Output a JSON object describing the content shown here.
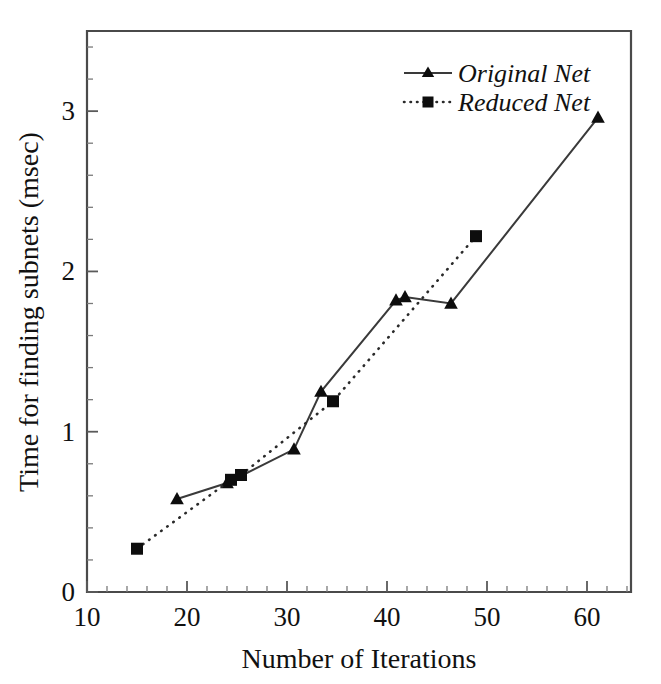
{
  "chart_data": {
    "type": "line",
    "title": "",
    "xlabel": "Number of Iterations",
    "ylabel": "Time for finding subnets (msec)",
    "xlim": [
      10,
      64.4
    ],
    "ylim": [
      0,
      3.5
    ],
    "xticks": [
      10,
      20,
      30,
      40,
      50,
      60
    ],
    "yticks": [
      0,
      1,
      2,
      3
    ],
    "xtick_labels": [
      "10",
      "20",
      "30",
      "40",
      "50",
      "60"
    ],
    "ytick_labels": [
      "0",
      "1",
      "2",
      "3"
    ],
    "x_minor_step": 2,
    "y_minor_step": 0.2,
    "grid": false,
    "legend_position": "top-right",
    "series": [
      {
        "name": "Original  Net",
        "marker": "triangle",
        "linestyle": "solid",
        "color": "#0d0d0d",
        "points": [
          {
            "x": 19.0,
            "y": 0.58
          },
          {
            "x": 24.0,
            "y": 0.68
          },
          {
            "x": 30.7,
            "y": 0.89
          },
          {
            "x": 33.4,
            "y": 1.25
          },
          {
            "x": 40.9,
            "y": 1.82
          },
          {
            "x": 41.8,
            "y": 1.84
          },
          {
            "x": 46.4,
            "y": 1.8
          },
          {
            "x": 61.1,
            "y": 2.96
          }
        ]
      },
      {
        "name": "Reduced  Net",
        "marker": "square",
        "linestyle": "dotted",
        "color": "#0d0d0d",
        "points": [
          {
            "x": 15.0,
            "y": 0.27
          },
          {
            "x": 24.4,
            "y": 0.7
          },
          {
            "x": 25.4,
            "y": 0.73
          },
          {
            "x": 34.6,
            "y": 1.19
          },
          {
            "x": 48.9,
            "y": 2.22
          }
        ]
      }
    ]
  },
  "legend": {
    "entries": [
      {
        "label": "Original  Net"
      },
      {
        "label": "Reduced  Net"
      }
    ]
  },
  "axes": {
    "x_title": "Number of Iterations",
    "y_title": "Time for finding subnets (msec)"
  }
}
